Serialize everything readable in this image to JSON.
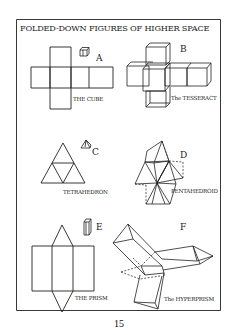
{
  "title": "FOLDED-DOWN FIGURES OF HIGHER SPACE",
  "figures": [
    {
      "letter": "A",
      "caption": "THE CUBE"
    },
    {
      "letter": "B",
      "caption": "The TESSERACT"
    },
    {
      "letter": "C",
      "caption": "TETRAHEDRON"
    },
    {
      "letter": "D",
      "caption": "PENTAHEDROID"
    },
    {
      "letter": "E",
      "caption": "THE PRISM"
    },
    {
      "letter": "F",
      "caption": "The HYPERPRISM"
    }
  ],
  "page_number": "15",
  "colors": {
    "ink": "#222222",
    "paper": "#ffffff"
  }
}
